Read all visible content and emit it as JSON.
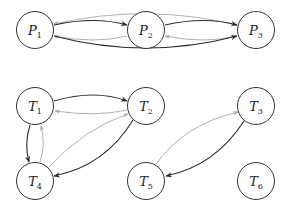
{
  "diagram": {
    "colors": {
      "dark_edge": "#2a2a2a",
      "light_edge": "#a8a8a8",
      "node_stroke": "#333333"
    },
    "nodes": [
      {
        "id": "P1",
        "letter": "P",
        "sub": "1"
      },
      {
        "id": "P2",
        "letter": "P",
        "sub": "2"
      },
      {
        "id": "P3",
        "letter": "P",
        "sub": "3"
      },
      {
        "id": "T1",
        "letter": "T",
        "sub": "1"
      },
      {
        "id": "T2",
        "letter": "T",
        "sub": "2"
      },
      {
        "id": "T3",
        "letter": "T",
        "sub": "3"
      },
      {
        "id": "T4",
        "letter": "T",
        "sub": "4"
      },
      {
        "id": "T5",
        "letter": "T",
        "sub": "5"
      },
      {
        "id": "T6",
        "letter": "T",
        "sub": "6"
      }
    ],
    "edges": [
      {
        "from": "P1",
        "to": "P2",
        "style": "dark"
      },
      {
        "from": "P2",
        "to": "P1",
        "style": "light"
      },
      {
        "from": "P1",
        "to": "P3",
        "style": "light"
      },
      {
        "from": "P1",
        "to": "P3",
        "style": "dark"
      },
      {
        "from": "P2",
        "to": "P3",
        "style": "dark"
      },
      {
        "from": "P3",
        "to": "P2",
        "style": "light"
      },
      {
        "from": "T1",
        "to": "T2",
        "style": "dark"
      },
      {
        "from": "T2",
        "to": "T1",
        "style": "light"
      },
      {
        "from": "T1",
        "to": "T4",
        "style": "dark"
      },
      {
        "from": "T4",
        "to": "T1",
        "style": "light"
      },
      {
        "from": "T4",
        "to": "T2",
        "style": "light"
      },
      {
        "from": "T2",
        "to": "T4",
        "style": "dark"
      },
      {
        "from": "T5",
        "to": "T3",
        "style": "light"
      },
      {
        "from": "T3",
        "to": "T5",
        "style": "dark"
      }
    ]
  }
}
